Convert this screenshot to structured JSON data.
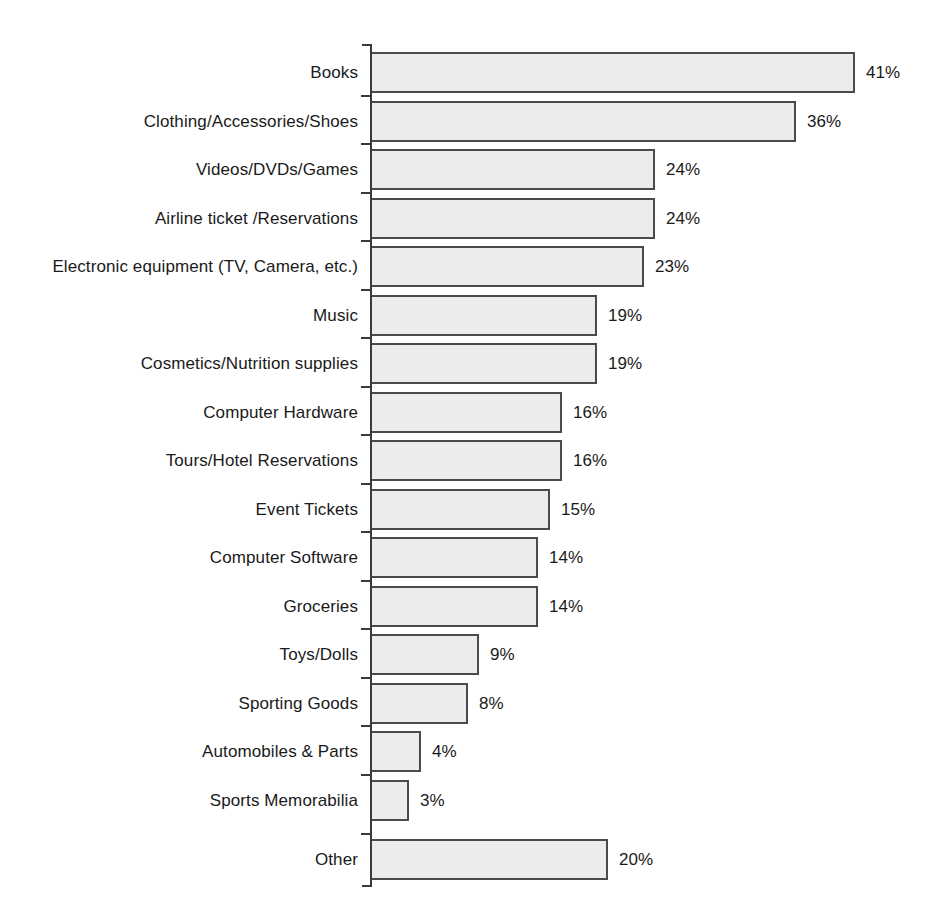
{
  "chart_data": {
    "type": "bar",
    "orientation": "horizontal",
    "title": "",
    "subtitle": "",
    "xlabel": "",
    "ylabel": "",
    "xlim": [
      0,
      41
    ],
    "grid": false,
    "legend": null,
    "value_suffix": "%",
    "categories": [
      "Books",
      "Clothing/Accessories/Shoes",
      "Videos/DVDs/Games",
      "Airline ticket /Reservations",
      "Electronic equipment (TV, Camera, etc.)",
      "Music",
      "Cosmetics/Nutrition supplies",
      "Computer Hardware",
      "Tours/Hotel Reservations",
      "Event Tickets",
      "Computer Software",
      "Groceries",
      "Toys/Dolls",
      "Sporting Goods",
      "Automobiles & Parts",
      "Sports Memorabilia",
      "Other"
    ],
    "values": [
      41,
      36,
      24,
      24,
      23,
      19,
      19,
      16,
      16,
      15,
      14,
      14,
      9,
      8,
      4,
      3,
      20
    ],
    "value_labels": [
      "41%",
      "36%",
      "24%",
      "24%",
      "23%",
      "19%",
      "19%",
      "16%",
      "16%",
      "15%",
      "14%",
      "14%",
      "9%",
      "8%",
      "4%",
      "3%",
      "20%"
    ],
    "colors": {
      "bar_fill": "#ececec",
      "bar_stroke": "#4a4a4a",
      "axis": "#3a3a3a",
      "text": "#1a1a1a",
      "background": "#ffffff"
    }
  }
}
